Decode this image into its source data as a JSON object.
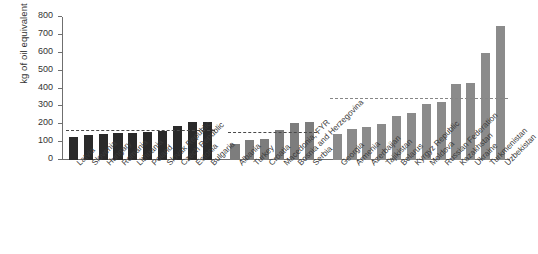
{
  "chart_data": {
    "type": "bar",
    "title": "",
    "xlabel": "",
    "ylabel": "kg of oil equivalent",
    "ylim": [
      0,
      800
    ],
    "yticks": [
      0,
      100,
      200,
      300,
      400,
      500,
      600,
      700,
      800
    ],
    "grid": false,
    "legend": "none",
    "groups": [
      {
        "name": "EU new member states",
        "color": "#2a2a2a",
        "reference_line": 162,
        "categories": [
          "Latvia",
          "Slovenia",
          "Hungary",
          "Romania",
          "Lithuania",
          "Poland",
          "Slovak Republic",
          "Czech Republic",
          "Estonia",
          "Bulgaria"
        ],
        "values": [
          126,
          139,
          143,
          152,
          153,
          155,
          161,
          190,
          210,
          213
        ]
      },
      {
        "name": "South Eastern Europe and Turkey",
        "color": "#7d7d7d",
        "reference_line": 150,
        "categories": [
          "Albania",
          "Turkey",
          "Croatia",
          "Macedonia, FYR",
          "Bosnia and Herzegovina",
          "Serbia"
        ],
        "values": [
          89,
          111,
          115,
          168,
          208,
          211
        ]
      },
      {
        "name": "Commonwealth of Independent States",
        "color": "#8b8b8b",
        "reference_line": 340,
        "categories": [
          "Georgia",
          "Armenia",
          "Azerbaijan",
          "Tajikistan",
          "Belarus",
          "Kyrgyz Republic",
          "Moldova",
          "Russian Federation",
          "Kazakhstan",
          "Ukraine",
          "Turkmenistan",
          "Uzbekistan"
        ],
        "values": [
          148,
          171,
          185,
          203,
          246,
          263,
          316,
          327,
          425,
          432,
          601,
          749
        ]
      }
    ]
  }
}
